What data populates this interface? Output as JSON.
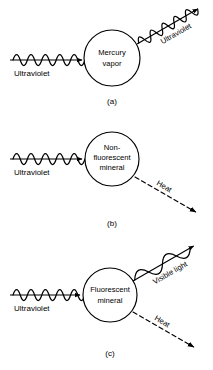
{
  "figure": {
    "background_color": "#ffffff",
    "stroke_color": "#000000"
  },
  "panels": [
    {
      "id": "a",
      "panel_label": "(a)",
      "node_label_line1": "Mercury",
      "node_label_line2": "vapor",
      "incoming": {
        "label": "Ultraviolet",
        "type": "wave",
        "wavelength": "short",
        "cycles": 5,
        "direction": "horizontal-right"
      },
      "outgoing": [
        {
          "label": "Ultraviolet",
          "type": "wave",
          "wavelength": "short",
          "cycles": 5,
          "direction": "up-right",
          "angle_deg": -30
        }
      ]
    },
    {
      "id": "b",
      "panel_label": "(b)",
      "node_label_line1": "Non-",
      "node_label_line2": "fluorescent",
      "node_label_line3": "mineral",
      "incoming": {
        "label": "Ultraviolet",
        "type": "wave",
        "wavelength": "short",
        "cycles": 5,
        "direction": "horizontal-right"
      },
      "outgoing": [
        {
          "label": "Heat",
          "type": "dashed-arrow",
          "direction": "down-right",
          "angle_deg": 30
        }
      ]
    },
    {
      "id": "c",
      "panel_label": "(c)",
      "node_label_line1": "Fluorescent",
      "node_label_line2": "mineral",
      "incoming": {
        "label": "Ultraviolet",
        "type": "wave",
        "wavelength": "short",
        "cycles": 5,
        "direction": "horizontal-right"
      },
      "outgoing": [
        {
          "label": "Visible light",
          "type": "wave",
          "wavelength": "long",
          "cycles": 2,
          "direction": "up-right",
          "angle_deg": -30
        },
        {
          "label": "Heat",
          "type": "dashed-arrow",
          "direction": "down-right",
          "angle_deg": 30
        }
      ]
    }
  ]
}
